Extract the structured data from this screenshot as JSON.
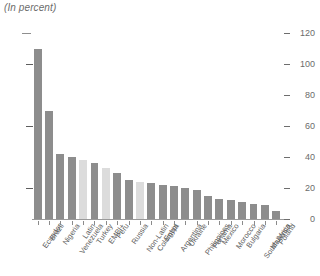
{
  "subtitle": "(In percent)",
  "chart_data": {
    "type": "bar",
    "title": "",
    "subtitle": "(In percent)",
    "xlabel": "",
    "ylabel": "",
    "ylim": [
      0,
      120
    ],
    "yticks": [
      0,
      20,
      40,
      60,
      80,
      100,
      120
    ],
    "ytick_labels": [
      "0",
      "20",
      "40",
      "60",
      "80",
      "100",
      "120"
    ],
    "axis_side": "right",
    "grid": false,
    "legend": null,
    "categories": [
      "Ecuador",
      "Brazil",
      "Nigeria",
      "Venezuela",
      "Latin",
      "Turkey",
      "EMBI+",
      "Peru",
      "Russia",
      "Non-Latin",
      "Colombia",
      "Egypt",
      "Argentina",
      "Ukraine",
      "Philippines",
      "Panama",
      "Mexico",
      "Morocco",
      "Bulgaria",
      "South Africa",
      "Malaysia",
      "Poland"
    ],
    "values": [
      110,
      70,
      42,
      40,
      38,
      36,
      33,
      30,
      25,
      24,
      23,
      22,
      21,
      20,
      19,
      15,
      13,
      12,
      11,
      10,
      9,
      5
    ],
    "series": [
      {
        "name": "Spread",
        "values": [
          110,
          70,
          42,
          40,
          38,
          36,
          33,
          30,
          25,
          24,
          23,
          22,
          21,
          20,
          19,
          15,
          13,
          12,
          11,
          10,
          9,
          5
        ]
      }
    ],
    "aggregate_categories": [
      "Latin",
      "EMBI+",
      "Non-Latin"
    ],
    "colors": {
      "bar": "#8d8d8d",
      "aggregate_bar": "#dcdcdc",
      "axis": "#6d6d6d",
      "text": "#6b6b6b",
      "background": "#ffffff"
    }
  }
}
